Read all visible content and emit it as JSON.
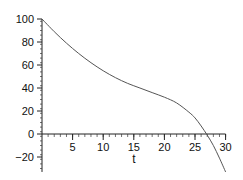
{
  "chart_data": {
    "type": "line",
    "title": "",
    "xlabel": "t",
    "ylabel": "",
    "xlim": [
      0,
      30
    ],
    "ylim": [
      -33,
      100
    ],
    "x_ticks": [
      5,
      10,
      15,
      20,
      25,
      30
    ],
    "y_ticks": [
      -20,
      0,
      20,
      40,
      60,
      80,
      100
    ],
    "grid": false,
    "legend": null,
    "series": [
      {
        "name": "curve",
        "color": "#555555",
        "x": [
          0,
          2,
          4,
          6,
          8,
          10,
          12,
          14,
          16,
          18,
          20,
          22,
          24,
          25,
          26,
          27,
          28,
          29,
          30
        ],
        "y": [
          100,
          89,
          79,
          70,
          62,
          55,
          49,
          44,
          40,
          36,
          32,
          27,
          19,
          14,
          7,
          -1,
          -10,
          -21,
          -33
        ]
      }
    ]
  }
}
